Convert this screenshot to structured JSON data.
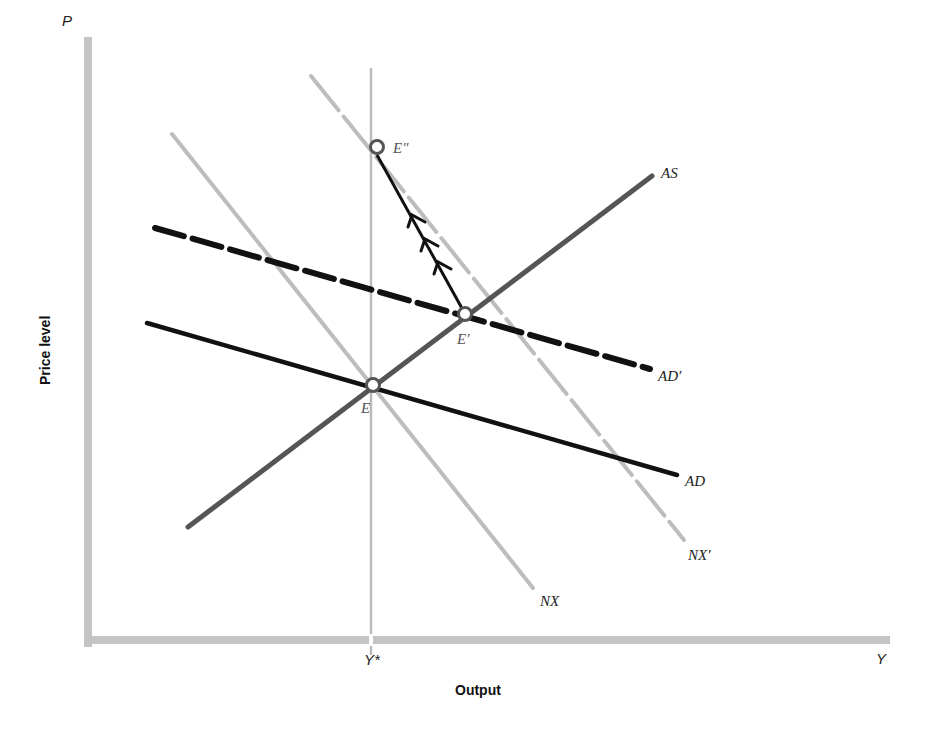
{
  "diagram": {
    "title": "",
    "axes": {
      "y_letter": "P",
      "x_letter": "Y",
      "y_title": "Price level",
      "x_title": "Output",
      "full_employment_label": "Y*"
    },
    "curves": [
      {
        "id": "AS",
        "label": "AS",
        "style": "solid",
        "color": "#555555",
        "description": "Aggregate supply, upward sloping"
      },
      {
        "id": "AD",
        "label": "AD",
        "style": "solid",
        "color": "#111111",
        "description": "Aggregate demand, downward sloping"
      },
      {
        "id": "AD_prime",
        "label": "AD′",
        "style": "dashed",
        "color": "#111111",
        "description": "Shifted aggregate demand"
      },
      {
        "id": "NX",
        "label": "NX",
        "style": "solid",
        "color": "#bbbbbb",
        "description": "Net exports schedule"
      },
      {
        "id": "NX_prime",
        "label": "NX′",
        "style": "dashed",
        "color": "#bbbbbb",
        "description": "Shifted net exports schedule"
      }
    ],
    "points": [
      {
        "id": "E",
        "label": "E"
      },
      {
        "id": "E_prime",
        "label": "E′"
      },
      {
        "id": "E_double_prime",
        "label": "E″"
      }
    ],
    "adjustment_path": {
      "from": "E′",
      "to": "E″",
      "arrows": 3
    }
  }
}
